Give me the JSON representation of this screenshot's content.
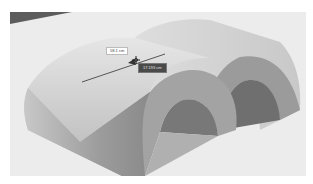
{
  "viewport": {
    "background": "#e9e9e9",
    "model": "two-arch-half-cylinder-solids"
  },
  "measurement": {
    "length_label": "58.1 cm",
    "offset_label": "17.193 cm"
  },
  "colors": {
    "arch_light": "#dcdcdc",
    "arch_mid": "#b5b5b5",
    "arch_dark": "#8a8a8a",
    "inner_shadow": "#6f6f6f",
    "ground": "#ececec",
    "corner_dark": "#5c5c5c"
  }
}
